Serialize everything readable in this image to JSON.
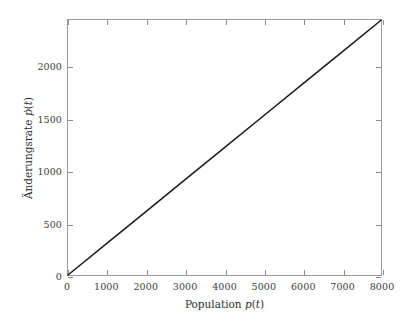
{
  "figure": {
    "background_color": "#ffffff",
    "axis_color": "#9a9a9a",
    "line_color": "#1a1a1a",
    "text_color": "#2f2f2f"
  },
  "axes": {
    "xlabel": "Population p(t)",
    "ylabel": "Änderungsrate ṗ(t)",
    "xticklabels": [
      "0",
      "1000",
      "2000",
      "3000",
      "4000",
      "5000",
      "6000",
      "7000",
      "8000"
    ],
    "yticklabels": [
      "0",
      "500",
      "1000",
      "1500",
      "2000"
    ]
  },
  "chart_data": {
    "type": "line",
    "title": "",
    "xlabel": "Population p(t)",
    "ylabel": "Änderungsrate ṗ(t)",
    "xlim": [
      0,
      8000
    ],
    "ylim": [
      0,
      2450
    ],
    "xticks": [
      0,
      1000,
      2000,
      3000,
      4000,
      5000,
      6000,
      7000,
      8000
    ],
    "yticks": [
      0,
      500,
      1000,
      1500,
      2000
    ],
    "grid": false,
    "legend": null,
    "series": [
      {
        "name": "Änderungsrate",
        "color": "#1a1a1a",
        "linewidth": 1.5,
        "x": [
          0,
          1000,
          2000,
          3000,
          4000,
          5000,
          6000,
          7000,
          8000
        ],
        "y": [
          0,
          306,
          612,
          918,
          1224,
          1530,
          1836,
          2142,
          2448
        ]
      }
    ]
  }
}
